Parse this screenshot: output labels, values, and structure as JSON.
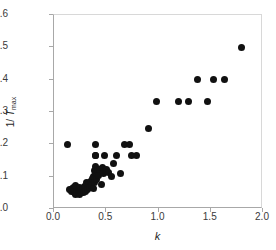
{
  "chart_data": {
    "type": "scatter",
    "title": "",
    "xlabel": "k",
    "ylabel_parts": {
      "prefix": "1/ ",
      "italic": "T",
      "subscript": "max"
    },
    "ylabel": "1/ Tmax",
    "xlim": [
      0.0,
      2.0
    ],
    "ylim": [
      0.0,
      0.6
    ],
    "xticks": [
      "0.0",
      "0.5",
      "1.0",
      "1.5",
      "2.0"
    ],
    "xtick_values": [
      0.0,
      0.5,
      1.0,
      1.5,
      2.0
    ],
    "yticks": [
      "0.0",
      "0.1",
      "0.2",
      "0.3",
      "0.4",
      "0.5",
      "0.6"
    ],
    "ytick_values": [
      0.0,
      0.1,
      0.2,
      0.3,
      0.4,
      0.5,
      0.6
    ],
    "grid": false,
    "legend": "none",
    "marker": "filled-circle",
    "marker_color": "#111111",
    "points": [
      [
        0.13,
        0.2
      ],
      [
        0.15,
        0.059
      ],
      [
        0.17,
        0.055
      ],
      [
        0.18,
        0.062
      ],
      [
        0.19,
        0.066
      ],
      [
        0.2,
        0.05
      ],
      [
        0.2,
        0.06
      ],
      [
        0.21,
        0.045
      ],
      [
        0.21,
        0.072
      ],
      [
        0.22,
        0.055
      ],
      [
        0.22,
        0.05
      ],
      [
        0.23,
        0.058
      ],
      [
        0.24,
        0.046
      ],
      [
        0.24,
        0.067
      ],
      [
        0.25,
        0.056
      ],
      [
        0.26,
        0.052
      ],
      [
        0.27,
        0.06
      ],
      [
        0.28,
        0.05
      ],
      [
        0.29,
        0.071
      ],
      [
        0.3,
        0.054
      ],
      [
        0.31,
        0.083
      ],
      [
        0.32,
        0.061
      ],
      [
        0.33,
        0.077
      ],
      [
        0.34,
        0.066
      ],
      [
        0.35,
        0.085
      ],
      [
        0.36,
        0.072
      ],
      [
        0.37,
        0.095
      ],
      [
        0.38,
        0.1
      ],
      [
        0.38,
        0.062
      ],
      [
        0.39,
        0.12
      ],
      [
        0.39,
        0.083
      ],
      [
        0.4,
        0.2
      ],
      [
        0.4,
        0.165
      ],
      [
        0.4,
        0.166
      ],
      [
        0.4,
        0.13
      ],
      [
        0.4,
        0.112
      ],
      [
        0.41,
        0.09
      ],
      [
        0.42,
        0.12
      ],
      [
        0.43,
        0.105
      ],
      [
        0.44,
        0.122
      ],
      [
        0.45,
        0.076
      ],
      [
        0.46,
        0.128
      ],
      [
        0.47,
        0.109
      ],
      [
        0.48,
        0.165
      ],
      [
        0.49,
        0.118
      ],
      [
        0.5,
        0.122
      ],
      [
        0.52,
        0.112
      ],
      [
        0.55,
        0.1
      ],
      [
        0.57,
        0.14
      ],
      [
        0.6,
        0.165
      ],
      [
        0.64,
        0.11
      ],
      [
        0.67,
        0.2
      ],
      [
        0.72,
        0.2
      ],
      [
        0.74,
        0.166
      ],
      [
        0.79,
        0.166
      ],
      [
        0.9,
        0.25
      ],
      [
        0.98,
        0.333
      ],
      [
        1.19,
        0.333
      ],
      [
        1.29,
        0.333
      ],
      [
        1.37,
        0.4
      ],
      [
        1.47,
        0.333
      ],
      [
        1.53,
        0.4
      ],
      [
        1.63,
        0.4
      ],
      [
        1.79,
        0.5
      ]
    ]
  }
}
